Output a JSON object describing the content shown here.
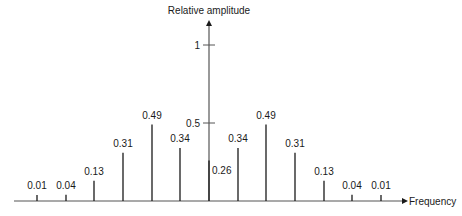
{
  "chart_data": {
    "type": "bar",
    "subtype": "stem",
    "title": "",
    "xlabel": "Frequency",
    "ylabel": "Relative amplitude",
    "y_ticks": [
      {
        "value": 0.5,
        "label": "0.5"
      },
      {
        "value": 1,
        "label": "1"
      }
    ],
    "ylim": [
      0,
      1.15
    ],
    "grid": false,
    "legend": null,
    "categories": [
      "-6",
      "-5",
      "-4",
      "-3",
      "-2",
      "-1",
      "0",
      "1",
      "2",
      "3",
      "4",
      "5",
      "6"
    ],
    "values": [
      0.01,
      0.04,
      0.13,
      0.31,
      0.49,
      0.34,
      0.26,
      0.34,
      0.49,
      0.31,
      0.13,
      0.04,
      0.01
    ],
    "labels": [
      "0.01",
      "0.04",
      "0.13",
      "0.31",
      "0.49",
      "0.34",
      "0.26",
      "0.34",
      "0.49",
      "0.31",
      "0.13",
      "0.04",
      "0.01"
    ]
  },
  "layout": {
    "baseline_y": 201,
    "axis_x": 209,
    "unit_px": 156,
    "first_x": 37,
    "spacing": 28.67,
    "x_axis_start": 14,
    "x_axis_end": 402,
    "y_axis_top": 20,
    "line_color": "#1a1a1a",
    "axis_color": "#555555"
  }
}
